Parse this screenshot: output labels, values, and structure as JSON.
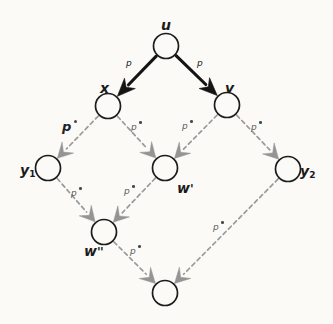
{
  "diagram": {
    "background_color": "#fbfaf7",
    "solid_edge_color": "#141414",
    "dashed_edge_color": "#9a9a9a",
    "node_stroke_color": "#1c1c1c",
    "nodes": [
      {
        "id": "u",
        "label": "u",
        "sub": "",
        "primes": "",
        "cx": 166,
        "cy": 46,
        "r": 12.5,
        "label_x": 161,
        "label_y": 18
      },
      {
        "id": "x",
        "label": "x",
        "sub": "",
        "primes": "",
        "cx": 108,
        "cy": 106,
        "r": 12.5,
        "label_x": 100,
        "label_y": 81
      },
      {
        "id": "v",
        "label": "v",
        "sub": "",
        "primes": "",
        "cx": 227,
        "cy": 105,
        "r": 12.5,
        "label_x": 225,
        "label_y": 81
      },
      {
        "id": "y1",
        "label": "y",
        "sub": "1",
        "primes": "",
        "cx": 48,
        "cy": 168,
        "r": 12.5,
        "label_x": 20,
        "label_y": 163
      },
      {
        "id": "wprime",
        "label": "w",
        "sub": "",
        "primes": "'",
        "cx": 165,
        "cy": 168,
        "r": 12.5,
        "label_x": 177,
        "label_y": 181
      },
      {
        "id": "y2",
        "label": "y",
        "sub": "2",
        "primes": "",
        "cx": 288,
        "cy": 169,
        "r": 12.5,
        "label_x": 300,
        "label_y": 164
      },
      {
        "id": "wdprime",
        "label": "w",
        "sub": "",
        "primes": "''",
        "cx": 104,
        "cy": 232,
        "r": 12.5,
        "label_x": 84,
        "label_y": 244
      },
      {
        "id": "bottom",
        "label": "",
        "sub": "",
        "primes": "",
        "cx": 165,
        "cy": 293,
        "r": 12.5,
        "label_x": 0,
        "label_y": 0
      }
    ],
    "edges": [
      {
        "id": "u-x",
        "from": "u",
        "to": "x",
        "style": "solid",
        "label": "p",
        "prime": false
      },
      {
        "id": "u-v",
        "from": "u",
        "to": "v",
        "style": "solid",
        "label": "p",
        "prime": false
      },
      {
        "id": "x-y1",
        "from": "x",
        "to": "y1",
        "style": "dashed",
        "label": "p",
        "prime": true
      },
      {
        "id": "x-wprime",
        "from": "x",
        "to": "wprime",
        "style": "dashed",
        "label": "p",
        "prime": true
      },
      {
        "id": "v-wprime",
        "from": "v",
        "to": "wprime",
        "style": "dashed",
        "label": "p",
        "prime": true
      },
      {
        "id": "v-y2",
        "from": "v",
        "to": "y2",
        "style": "dashed",
        "label": "p",
        "prime": true
      },
      {
        "id": "y1-wdprime",
        "from": "y1",
        "to": "wdprime",
        "style": "dashed",
        "label": "p",
        "prime": true
      },
      {
        "id": "wprime-wdprime",
        "from": "wprime",
        "to": "wdprime",
        "style": "dashed",
        "label": "p",
        "prime": true
      },
      {
        "id": "wdprime-bottom",
        "from": "wdprime",
        "to": "bottom",
        "style": "dashed",
        "label": "p",
        "prime": true
      },
      {
        "id": "y2-bottom",
        "from": "y2",
        "to": "bottom",
        "style": "dashed",
        "label": "p",
        "prime": true
      }
    ],
    "edge_labels": [
      {
        "id": "lbl-u-x",
        "text": "p",
        "prime": false,
        "size": "small",
        "tone": "solid",
        "x": 126,
        "y": 59
      },
      {
        "id": "lbl-u-v",
        "text": "p",
        "prime": false,
        "size": "small",
        "tone": "solid",
        "x": 197,
        "y": 59
      },
      {
        "id": "lbl-x-y1",
        "text": "p",
        "prime": true,
        "size": "big",
        "tone": "dashed",
        "x": 62,
        "y": 120
      },
      {
        "id": "lbl-x-wprime",
        "text": "p",
        "prime": true,
        "size": "small",
        "tone": "dashed",
        "x": 131,
        "y": 121
      },
      {
        "id": "lbl-v-wprime",
        "text": "p",
        "prime": true,
        "size": "small",
        "tone": "dashed",
        "x": 182,
        "y": 120
      },
      {
        "id": "lbl-v-y2",
        "text": "p",
        "prime": true,
        "size": "small",
        "tone": "dashed",
        "x": 251,
        "y": 121
      },
      {
        "id": "lbl-y1-wdprime",
        "text": "p",
        "prime": true,
        "size": "small",
        "tone": "dashed",
        "x": 71,
        "y": 187
      },
      {
        "id": "lbl-wprime-wdprime",
        "text": "p",
        "prime": true,
        "size": "small",
        "tone": "dashed",
        "x": 124,
        "y": 185
      },
      {
        "id": "lbl-wdprime-bottom",
        "text": "p",
        "prime": true,
        "size": "small",
        "tone": "dashed",
        "x": 130,
        "y": 245
      },
      {
        "id": "lbl-y2-bottom",
        "text": "p",
        "prime": true,
        "size": "small",
        "tone": "dashed",
        "x": 213,
        "y": 221
      }
    ]
  }
}
